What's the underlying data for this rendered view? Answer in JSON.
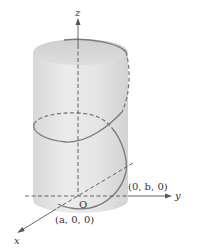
{
  "figure": {
    "type": "3d-helix-on-cylinder",
    "colors": {
      "background": "#ffffff",
      "cylinder_fill": "#e2e2e2",
      "cylinder_top": "#d4d4d4",
      "helix": "#7a7a7a",
      "axis": "#555555"
    },
    "axes": {
      "z_label": "z",
      "y_label": "y",
      "x_label": "x",
      "origin_label": "O"
    },
    "points": {
      "y_intercept": "(0, b, 0)",
      "x_intercept": "(a, 0, 0)"
    }
  }
}
